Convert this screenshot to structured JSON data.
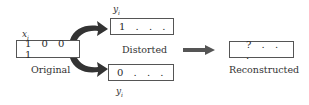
{
  "original": {
    "var_label": "x",
    "var_sub": "i",
    "value": "1 0 0 1",
    "caption": "Original"
  },
  "distorted_top": {
    "var_label": "y",
    "var_sub": "i",
    "value": "1 . . ."
  },
  "distorted_bottom": {
    "var_label": "y",
    "var_sub": "i",
    "value": "0 . . ."
  },
  "distorted_caption": "Distorted",
  "reconstructed": {
    "value": "? . . .",
    "caption": "Reconstructed"
  },
  "colors": {
    "arrow": "#3a3a3a",
    "box_border": "#555555"
  }
}
